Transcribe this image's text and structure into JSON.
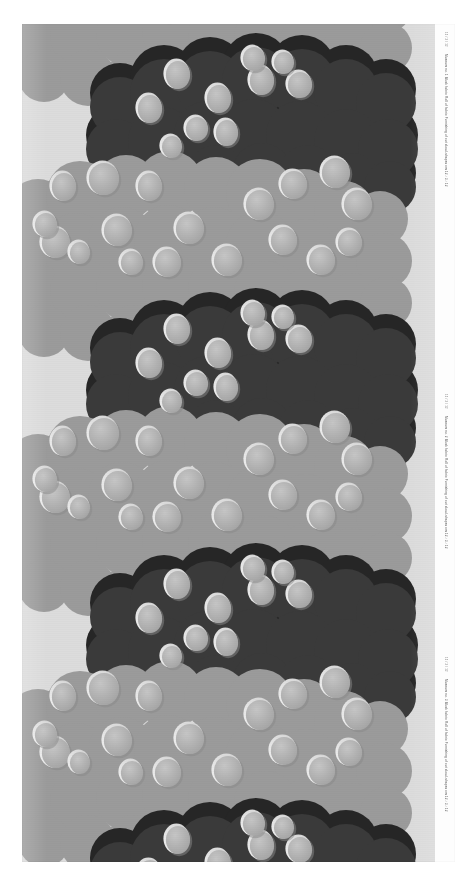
{
  "image": {
    "kind": "scanned-textile-design",
    "title": "Printed furnishing fabric with scalloped cloud-and-dot repeat",
    "width_px": 475,
    "height_px": 885,
    "plate": {
      "x": 22,
      "y": 24,
      "width": 433,
      "height": 838
    }
  },
  "palette": {
    "page_background": "#ffffff",
    "ground": "#dcdcdc",
    "dark_cloud": "#3a3a3a",
    "darkest_cloud": "#202020",
    "mid_cloud": "#9a9a9a",
    "dot_fill": "#b2b2b2",
    "dot_highlight": "#e8e8e8",
    "dot_shadow": "#8d8d8d",
    "caption_text": "#4a4a4a"
  },
  "caption": {
    "lines": [
      "Museum no. 1  Block fabric  Roll of fabric  Furnishing of cut cloud-shapes   cm 12 / 3 / 12",
      "Museum no. 2  Block fabric  Roll of fabric  Furnishing of cut cloud-shapes   cm 12 / 3 / 12",
      "Museum no. 3  Block fabric  Roll of fabric  Furnishing of cut cloud-shapes   cm 12 / 3 / 12"
    ],
    "codes": [
      "12 / 3 / 12",
      "12 / 3 / 12",
      "12 / 3 / 12"
    ]
  },
  "pattern": {
    "type": "vertical-repeat",
    "repeat_height_px": 255,
    "description": "Alternating bands of dark charcoal and mid-grey scalloped cloud masses overlaid with pale elliptical dots",
    "band_count": 7,
    "dot_count_visible": 96
  },
  "chart_data": {
    "type": "table",
    "columns": [
      "Band",
      "Tone",
      "Top (px)",
      "Height (px)",
      "Dots"
    ],
    "rows": [
      [
        "1",
        "dark",
        "0",
        "120",
        "10"
      ],
      [
        "2",
        "mid",
        "60",
        "200",
        "22"
      ],
      [
        "3",
        "dark",
        "255",
        "120",
        "10"
      ],
      [
        "4",
        "mid",
        "315",
        "200",
        "22"
      ],
      [
        "5",
        "dark",
        "510",
        "120",
        "10"
      ],
      [
        "6",
        "mid",
        "570",
        "200",
        "22"
      ],
      [
        "7",
        "dark",
        "765",
        "120",
        "10"
      ]
    ]
  }
}
